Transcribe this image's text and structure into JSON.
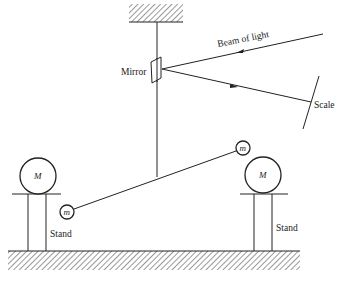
{
  "diagram": {
    "labels": {
      "mirror": "Mirror",
      "beam": "Beam of light",
      "scale": "Scale",
      "stand_left": "Stand",
      "stand_right": "Stand",
      "large_mass_left": "M",
      "large_mass_right": "M",
      "small_mass_left": "m",
      "small_mass_right": "m"
    },
    "colors": {
      "ink": "#222222",
      "background": "#ffffff"
    }
  }
}
